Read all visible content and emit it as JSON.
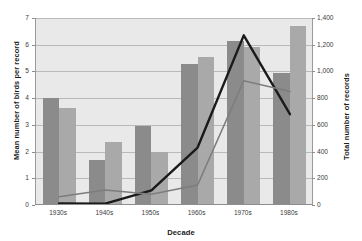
{
  "chart_data": {
    "type": "bar",
    "title": "",
    "subtitle": "",
    "xlabel": "Decade",
    "ylabel": "Mean number of birds per record",
    "y2label": "Total number of records",
    "categories": [
      "1930s",
      "1940s",
      "1950s",
      "1960s",
      "1970s",
      "1980s"
    ],
    "ylim": [
      0,
      7
    ],
    "y2lim": [
      0,
      1400
    ],
    "yticks": [
      0,
      1,
      2,
      3,
      4,
      5,
      6,
      7
    ],
    "ytick_labels": [
      "0",
      "1",
      "2",
      "3",
      "4",
      "5",
      "6",
      "7"
    ],
    "y2ticks": [
      0,
      200,
      400,
      600,
      800,
      1000,
      1200,
      1400
    ],
    "y2tick_labels": [
      "0",
      "200",
      "400",
      "600",
      "800",
      "1,000",
      "1,200",
      "1,400"
    ],
    "grid": true,
    "legend": "none",
    "bar_series": [
      {
        "name": "Mean birds per record (series 1)",
        "axis": "left",
        "color": "#8b8b8b",
        "values": [
          4.0,
          1.7,
          2.97,
          5.27,
          6.13,
          4.95
        ]
      },
      {
        "name": "Mean birds per record (series 2)",
        "axis": "left",
        "color": "#a9a9a9",
        "values": [
          3.63,
          2.37,
          1.97,
          5.55,
          5.93,
          6.72
        ]
      }
    ],
    "line_series": [
      {
        "name": "Total number of records (series 1)",
        "axis": "right",
        "color": "#1a1a1a",
        "values": [
          12,
          10,
          110,
          430,
          1270,
          680
        ]
      },
      {
        "name": "Total number of records (series 2)",
        "axis": "right",
        "color": "#7d7d7d",
        "values": [
          62,
          112,
          80,
          150,
          930,
          850
        ]
      }
    ]
  },
  "style": {
    "plot_background": "#e9e9e9",
    "page_background": "#ffffff",
    "gridline_color": "#b9b9b9",
    "axis_color": "#8d8d8d",
    "text_color": "#1d1d1d"
  }
}
